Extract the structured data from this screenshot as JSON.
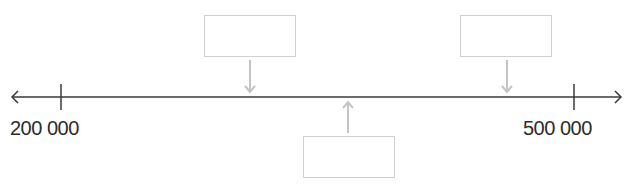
{
  "number_line": {
    "min_label": "200 000",
    "max_label": "500 000",
    "min_value": 200000,
    "max_value": 500000,
    "line_color": "#3a3a3a",
    "pointer_color": "#c4c4c4",
    "box_border_color": "#d0d0d0"
  },
  "answer_boxes": [
    {
      "id": "box-1",
      "value": "",
      "pointer_direction": "down",
      "position_value": 275000
    },
    {
      "id": "box-2",
      "value": "",
      "pointer_direction": "down",
      "position_value": 450000
    },
    {
      "id": "box-3",
      "value": "",
      "pointer_direction": "up",
      "position_value": 350000
    }
  ]
}
